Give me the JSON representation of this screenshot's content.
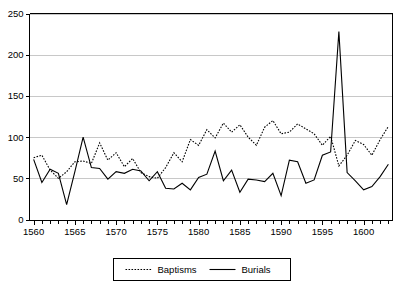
{
  "chart_data": {
    "type": "line",
    "title": "",
    "subtitle": "",
    "xlabel": "",
    "ylabel": "",
    "xlim": [
      1559.5,
      1603.5
    ],
    "ylim": [
      0,
      250
    ],
    "grid": true,
    "grid_axis": "y",
    "legend_position": "bottom",
    "y_ticks": [
      0,
      50,
      100,
      150,
      200,
      250
    ],
    "y_tick_labels": [
      "0",
      "50",
      "100",
      "150",
      "200",
      "250"
    ],
    "x_ticks": [
      1560,
      1565,
      1570,
      1575,
      1580,
      1585,
      1590,
      1595,
      1600
    ],
    "x_tick_labels": [
      "1560",
      "1565",
      "1570",
      "1575",
      "1580",
      "1585",
      "1590",
      "1595",
      "1600"
    ],
    "x_minor_tick_interval": 1,
    "x": [
      1560,
      1561,
      1562,
      1563,
      1564,
      1565,
      1566,
      1567,
      1568,
      1569,
      1570,
      1571,
      1572,
      1573,
      1574,
      1575,
      1576,
      1577,
      1578,
      1579,
      1580,
      1581,
      1582,
      1583,
      1584,
      1585,
      1586,
      1587,
      1588,
      1589,
      1590,
      1591,
      1592,
      1593,
      1594,
      1595,
      1596,
      1597,
      1598,
      1599,
      1600,
      1601,
      1602,
      1603
    ],
    "series": [
      {
        "name": "Baptisms",
        "style": "dotted",
        "color": "#000000",
        "values": [
          75,
          78,
          60,
          50,
          58,
          70,
          71,
          68,
          93,
          72,
          81,
          64,
          74,
          57,
          52,
          50,
          63,
          81,
          70,
          97,
          90,
          109,
          99,
          117,
          106,
          115,
          100,
          90,
          112,
          120,
          104,
          106,
          116,
          110,
          104,
          90,
          101,
          65,
          78,
          96,
          91,
          78,
          97,
          113
        ]
      },
      {
        "name": "Burials",
        "style": "solid",
        "color": "#000000",
        "values": [
          73,
          45,
          61,
          56,
          18,
          58,
          100,
          63,
          62,
          49,
          58,
          56,
          61,
          59,
          47,
          58,
          38,
          37,
          44,
          36,
          51,
          55,
          83,
          47,
          60,
          33,
          49,
          48,
          46,
          56,
          29,
          72,
          70,
          44,
          48,
          78,
          82,
          228,
          57,
          47,
          36,
          40,
          52,
          67
        ]
      }
    ]
  },
  "legend": {
    "entries": [
      {
        "label": "Baptisms",
        "style": "dotted"
      },
      {
        "label": "Burials",
        "style": "solid"
      }
    ]
  }
}
